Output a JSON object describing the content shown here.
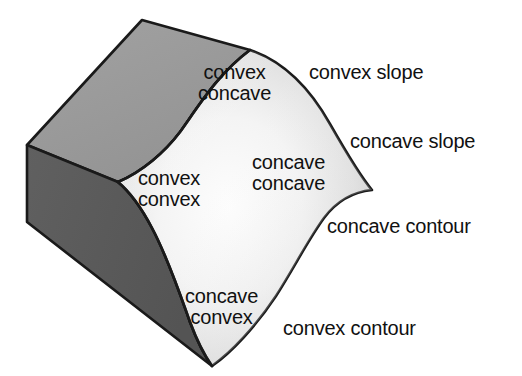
{
  "figure": {
    "background_color": "#ffffff",
    "colors": {
      "top_face": "#9a9a9a",
      "side_face": "#5a5a5a",
      "surface_light": "#fbfbfb",
      "surface_shadow": "#c9c9c9",
      "outline": "#1a1a1a",
      "text": "#111111"
    }
  },
  "surface_labels": [
    {
      "name": "convex-concave",
      "line1": "convex",
      "line2": "concave",
      "x": 198,
      "y": 62
    },
    {
      "name": "convex-convex",
      "line1": "convex",
      "line2": "convex",
      "x": 138,
      "y": 168
    },
    {
      "name": "concave-concave",
      "line1": "concave",
      "line2": "concave",
      "x": 252,
      "y": 152
    },
    {
      "name": "concave-convex",
      "line1": "concave",
      "line2": "convex",
      "x": 185,
      "y": 286
    }
  ],
  "annotation_labels": [
    {
      "name": "convex-slope",
      "text": "convex slope",
      "x": 309,
      "y": 62
    },
    {
      "name": "concave-slope",
      "text": "concave slope",
      "x": 350,
      "y": 131
    },
    {
      "name": "concave-contour",
      "text": "concave contour",
      "x": 327,
      "y": 216
    },
    {
      "name": "convex-contour",
      "text": "convex contour",
      "x": 283,
      "y": 318
    }
  ]
}
